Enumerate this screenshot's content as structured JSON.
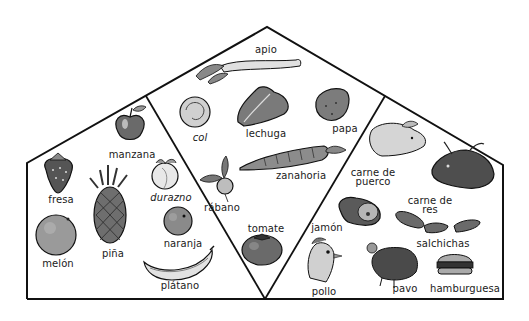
{
  "diagram": {
    "type": "food-pyramid-house",
    "sections": {
      "fruits": {
        "name": "fruits-section",
        "items": [
          {
            "id": "manzana",
            "label": "manzana",
            "x": 132,
            "y": 150
          },
          {
            "id": "fresa",
            "label": "fresa",
            "x": 61,
            "y": 197
          },
          {
            "id": "durazno",
            "label": "durazno",
            "x": 171,
            "y": 195
          },
          {
            "id": "melon",
            "label": "melón",
            "x": 58,
            "y": 262
          },
          {
            "id": "pina",
            "label": "piña",
            "x": 113,
            "y": 251
          },
          {
            "id": "naranja",
            "label": "naranja",
            "x": 183,
            "y": 241
          },
          {
            "id": "platano",
            "label": "plátano",
            "x": 180,
            "y": 283
          }
        ]
      },
      "vegetables": {
        "name": "vegetables-section",
        "items": [
          {
            "id": "apio",
            "label": "apio",
            "x": 266,
            "y": 47
          },
          {
            "id": "col",
            "label": "col",
            "x": 200,
            "y": 134
          },
          {
            "id": "lechuga",
            "label": "lechuga",
            "x": 266,
            "y": 131
          },
          {
            "id": "papa",
            "label": "papa",
            "x": 345,
            "y": 127
          },
          {
            "id": "zanahoria",
            "label": "zanahoria",
            "x": 301,
            "y": 173
          },
          {
            "id": "rabano",
            "label": "rábano",
            "x": 222,
            "y": 208
          },
          {
            "id": "tomate",
            "label": "tomate",
            "x": 266,
            "y": 227
          }
        ]
      },
      "meats": {
        "name": "meats-section",
        "items": [
          {
            "id": "carne-de-puerco",
            "label": "carne de",
            "label2": "puerco",
            "x": 373,
            "y": 173
          },
          {
            "id": "carne-de-res",
            "label": "carne de",
            "label2": "res",
            "x": 430,
            "y": 199
          },
          {
            "id": "jamon",
            "label": "jamón",
            "x": 327,
            "y": 225
          },
          {
            "id": "salchichas",
            "label": "salchichas",
            "x": 443,
            "y": 242
          },
          {
            "id": "pollo",
            "label": "pollo",
            "x": 324,
            "y": 289
          },
          {
            "id": "pavo",
            "label": "pavo",
            "x": 405,
            "y": 286
          },
          {
            "id": "hamburguesa",
            "label": "hamburguesa",
            "x": 465,
            "y": 286
          }
        ]
      }
    },
    "colors": {
      "outline": "#111111",
      "background": "#ffffff",
      "label": "#1a1a1a"
    }
  }
}
